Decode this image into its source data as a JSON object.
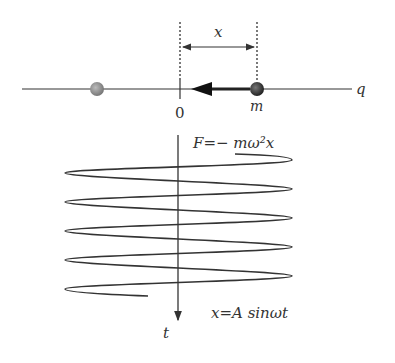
{
  "diagram": {
    "labels": {
      "x_distance": "x",
      "axis_q": "q",
      "origin": "0",
      "mass": "m",
      "force_eq": "F=− mω²x",
      "time_axis": "t",
      "motion_eq": "x=A sinωt"
    },
    "colors": {
      "line": "#333333",
      "ball_left": "#8a8a8a",
      "ball_right": "#3a3a3a"
    }
  }
}
